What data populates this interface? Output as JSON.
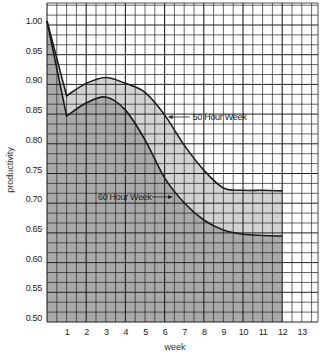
{
  "chart_data": {
    "type": "area",
    "title": "",
    "xlabel": "week",
    "ylabel": "productivity",
    "xlim": [
      0,
      13.5
    ],
    "ylim": [
      0.5,
      1.0
    ],
    "x_ticks": [
      "1",
      "2",
      "3",
      "4",
      "5",
      "6",
      "7",
      "8",
      "9",
      "10",
      "11",
      "12",
      "13"
    ],
    "y_ticks": [
      "1.00",
      "0.95",
      "0.90",
      "0.85",
      "0.80",
      "0.75",
      "0.70",
      "0.65",
      "0.60",
      "0.55",
      "0.50"
    ],
    "grid": true,
    "x": [
      0,
      1,
      2,
      3,
      4,
      5,
      6,
      7,
      8,
      9,
      10,
      11,
      12
    ],
    "series": [
      {
        "name": "50 Hour Week",
        "values": [
          1.0,
          0.874,
          0.895,
          0.905,
          0.895,
          0.88,
          0.842,
          0.791,
          0.749,
          0.719,
          0.715,
          0.715,
          0.714
        ],
        "fill": "#d2d2d2"
      },
      {
        "name": "60 Hour Week",
        "values": [
          1.0,
          0.84,
          0.862,
          0.872,
          0.85,
          0.8,
          0.736,
          0.694,
          0.665,
          0.648,
          0.641,
          0.639,
          0.638
        ],
        "fill": "#a9a9a9"
      }
    ],
    "annotations": [
      {
        "text": "50 Hour Week",
        "arrow_to_week": 6.0,
        "arrow_to_value": 0.835
      },
      {
        "text": "60 Hour Week",
        "arrow_to_week": 6.3,
        "arrow_to_value": 0.705
      }
    ]
  }
}
